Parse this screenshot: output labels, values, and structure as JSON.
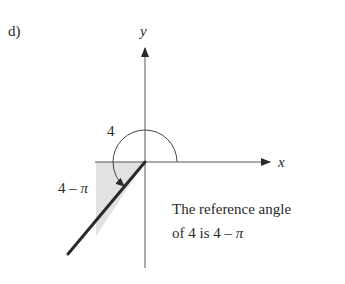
{
  "label": "d)",
  "axes": {
    "x_label": "x",
    "y_label": "y"
  },
  "angle": {
    "value_label": "4",
    "reference_label": "4 – π",
    "radians": 4
  },
  "caption": {
    "line1": "The reference angle",
    "line2_prefix": "of 4 is 4 – ",
    "line2_pi": "π"
  },
  "colors": {
    "ink": "#2a2a2a",
    "axis": "#555555",
    "shade": "#e2e2e2"
  }
}
